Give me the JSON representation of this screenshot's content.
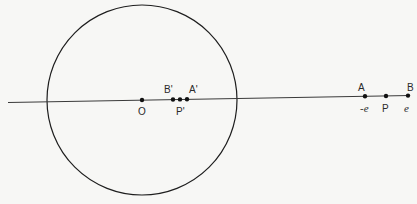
{
  "diagram": {
    "circle": {
      "cx": 142,
      "cy": 100,
      "r": 95,
      "stroke": "#1e1e1e"
    },
    "line": {
      "x1": 8,
      "y1": 102.5,
      "x2": 410,
      "y2": 95.5,
      "stroke": "#3a3a3a"
    },
    "points": [
      {
        "id": "O",
        "label": "O",
        "x": 142,
        "y": 100,
        "label_x": 138,
        "label_y": 115
      },
      {
        "id": "B_prime",
        "label": "B'",
        "x": 173,
        "y": 99.5,
        "label_x": 164,
        "label_y": 93
      },
      {
        "id": "P_prime",
        "label": "P'",
        "x": 180,
        "y": 99.4,
        "label_x": 176,
        "label_y": 115
      },
      {
        "id": "A_prime",
        "label": "A'",
        "x": 187,
        "y": 99.3,
        "label_x": 189,
        "label_y": 93
      },
      {
        "id": "A",
        "label": "A",
        "x": 365,
        "y": 96.3,
        "label_x": 358,
        "label_y": 91
      },
      {
        "id": "P",
        "label": "P",
        "x": 386,
        "y": 96,
        "label_x": 382,
        "label_y": 112
      },
      {
        "id": "B",
        "label": "B",
        "x": 408,
        "y": 95.6,
        "label_x": 407,
        "label_y": 91
      }
    ],
    "value_labels": [
      {
        "id": "minus_e",
        "text": "-e",
        "x": 360,
        "y": 112
      },
      {
        "id": "e",
        "text": "e",
        "x": 404,
        "y": 112
      }
    ]
  }
}
